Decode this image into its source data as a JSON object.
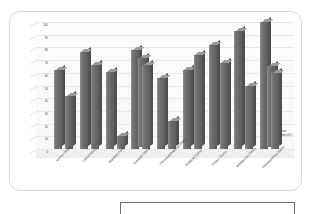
{
  "chart": {
    "title": "",
    "legend": {
      "series1_label": "Sum",
      "series2_label": "Sum of C"
    }
  },
  "chart_data": {
    "type": "bar",
    "title": "",
    "subtitle": "",
    "xlabel": "",
    "ylabel": "",
    "ylim": [
      0,
      100
    ],
    "grid": true,
    "legend_position": "bottom-right",
    "style": "3d-clustered-column",
    "bar_color": "#6b6b6b",
    "bar_top_color": "#9a9a9a",
    "bar_side_color": "#4f4f4f",
    "categories": [
      "Kannur District",
      "Calicut District",
      "Wayanad District",
      "Kottayam District",
      "Thiruvananthapuram District",
      "Palakkad District",
      "Thrissur District",
      "Malappuram District",
      "Pathanamthitta District"
    ],
    "tick_labels": [
      "0",
      "10",
      "20",
      "30",
      "40",
      "50",
      "60",
      "70",
      "80",
      "90",
      "100"
    ],
    "series": [
      {
        "name": "Sum",
        "values": [
          62,
          76,
          61,
          78,
          56,
          62,
          82,
          93,
          100
        ]
      },
      {
        "name": "Sum of C",
        "values": [
          42,
          66,
          10,
          66,
          22,
          74,
          68,
          50,
          60
        ]
      }
    ],
    "series3": {
      "name": "Sum of C",
      "values": [
        null,
        null,
        null,
        70,
        null,
        null,
        null,
        null,
        64
      ]
    }
  }
}
